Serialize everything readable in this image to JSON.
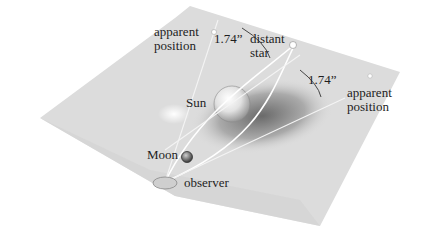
{
  "figure": {
    "type": "gravitational lensing illustration",
    "labels": {
      "apparent_position_left": [
        "apparent",
        "position"
      ],
      "apparent_position_right": [
        "apparent",
        "position"
      ],
      "distant_star": [
        "distant",
        "star"
      ],
      "angle_left": "1.74”",
      "angle_right": "1.74”",
      "sun": "Sun",
      "moon": "Moon",
      "observer": "observer"
    }
  }
}
